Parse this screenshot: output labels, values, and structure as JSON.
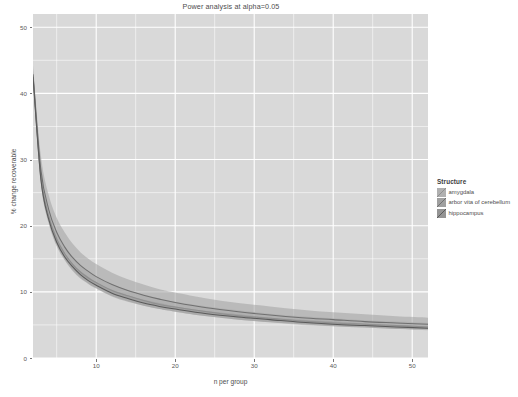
{
  "chart_data": {
    "type": "line",
    "title": "Power analysis at alpha=0.05",
    "xlabel": "n per group",
    "ylabel": "% change recoverable",
    "xlim": [
      2,
      52
    ],
    "ylim": [
      0,
      52
    ],
    "xticks": [
      10,
      20,
      30,
      40,
      50
    ],
    "yticks": [
      0,
      10,
      20,
      30,
      40,
      50
    ],
    "grid": true,
    "legend_position": "right",
    "legend_title": "Structure",
    "panel_background": "#d9d9d9",
    "grid_color": "#ffffff",
    "x": [
      2,
      3,
      4,
      5,
      6,
      7,
      8,
      9,
      10,
      12,
      14,
      16,
      18,
      20,
      24,
      28,
      32,
      36,
      40,
      44,
      48,
      52
    ],
    "series": [
      {
        "name": "amygdala",
        "color": "#8f8f8f",
        "ribbon_color": "#b0b0b0",
        "values": [
          42.8,
          27.5,
          21.4,
          18.0,
          15.8,
          14.2,
          13.0,
          12.1,
          11.4,
          10.2,
          9.4,
          8.7,
          8.1,
          7.7,
          7.0,
          6.4,
          6.0,
          5.6,
          5.3,
          5.1,
          4.9,
          4.7
        ],
        "lower": [
          42.0,
          26.6,
          20.6,
          17.2,
          15.0,
          13.4,
          12.2,
          11.3,
          10.6,
          9.4,
          8.6,
          7.9,
          7.4,
          7.0,
          6.3,
          5.8,
          5.4,
          5.0,
          4.8,
          4.6,
          4.4,
          4.2
        ],
        "upper": [
          43.6,
          28.6,
          22.4,
          19.0,
          16.8,
          15.2,
          14.0,
          13.1,
          12.3,
          11.1,
          10.3,
          9.6,
          9.0,
          8.5,
          7.8,
          7.2,
          6.7,
          6.3,
          6.0,
          5.7,
          5.5,
          5.3
        ]
      },
      {
        "name": "arbor vita of cerebellum",
        "color": "#707070",
        "ribbon_color": "#a0a0a0",
        "values": [
          42.9,
          28.4,
          22.4,
          19.0,
          16.8,
          15.2,
          14.0,
          13.1,
          12.3,
          11.1,
          10.2,
          9.5,
          8.9,
          8.4,
          7.6,
          7.0,
          6.5,
          6.1,
          5.8,
          5.5,
          5.3,
          5.1
        ],
        "lower": [
          41.6,
          26.8,
          20.8,
          17.5,
          15.3,
          13.8,
          12.6,
          11.7,
          11.0,
          9.8,
          9.0,
          8.3,
          7.8,
          7.4,
          6.7,
          6.1,
          5.7,
          5.3,
          5.0,
          4.8,
          4.6,
          4.4
        ],
        "upper": [
          44.2,
          30.6,
          24.6,
          21.2,
          19.0,
          17.3,
          16.0,
          15.0,
          14.2,
          12.9,
          11.9,
          11.1,
          10.4,
          9.9,
          9.0,
          8.3,
          7.8,
          7.3,
          6.9,
          6.6,
          6.3,
          6.1
        ]
      },
      {
        "name": "hippocampus",
        "color": "#5a5a5a",
        "ribbon_color": "#959595",
        "values": [
          42.5,
          27.0,
          20.9,
          17.5,
          15.3,
          13.8,
          12.6,
          11.7,
          11.0,
          9.8,
          9.0,
          8.3,
          7.8,
          7.4,
          6.7,
          6.2,
          5.8,
          5.4,
          5.1,
          4.9,
          4.7,
          4.5
        ],
        "lower": [
          41.9,
          26.3,
          20.3,
          16.9,
          14.8,
          13.2,
          12.0,
          11.2,
          10.5,
          9.3,
          8.5,
          7.9,
          7.4,
          7.0,
          6.3,
          5.8,
          5.4,
          5.1,
          4.8,
          4.6,
          4.4,
          4.3
        ],
        "upper": [
          43.1,
          27.8,
          21.6,
          18.2,
          15.9,
          14.3,
          13.1,
          12.3,
          11.5,
          10.3,
          9.5,
          8.8,
          8.3,
          7.8,
          7.1,
          6.6,
          6.1,
          5.8,
          5.5,
          5.2,
          5.0,
          4.8
        ]
      }
    ]
  }
}
